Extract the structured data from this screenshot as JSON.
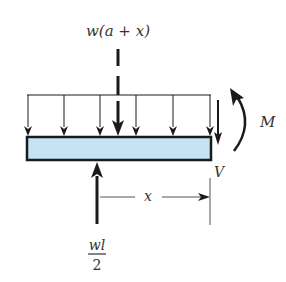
{
  "diagram": {
    "type": "free-body-diagram",
    "labels": {
      "resultant_load": "w(a + x)",
      "moment": "M",
      "shear": "V",
      "distance": "x",
      "reaction_numerator": "wl",
      "reaction_denominator": "2"
    },
    "colors": {
      "beam_fill": "#c6e2f5",
      "line": "#1a1a1a",
      "text": "#333333"
    },
    "distributed_load_arrow_count": 7
  }
}
